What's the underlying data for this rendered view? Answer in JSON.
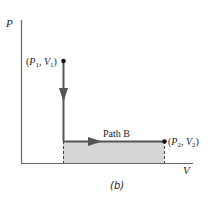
{
  "diagram": {
    "axes": {
      "y_label": "P",
      "x_label": "V"
    },
    "points": [
      {
        "id": "start",
        "label_p": "P",
        "label_v": "V",
        "sub": "1"
      },
      {
        "id": "end",
        "label_p": "P",
        "label_v": "V",
        "sub": "2"
      }
    ],
    "path_label": "Path B",
    "caption": "(b)",
    "colors": {
      "path": "#555555",
      "area_fill": "#d6d6d6",
      "axis": "#555555",
      "point": "#111111"
    }
  }
}
